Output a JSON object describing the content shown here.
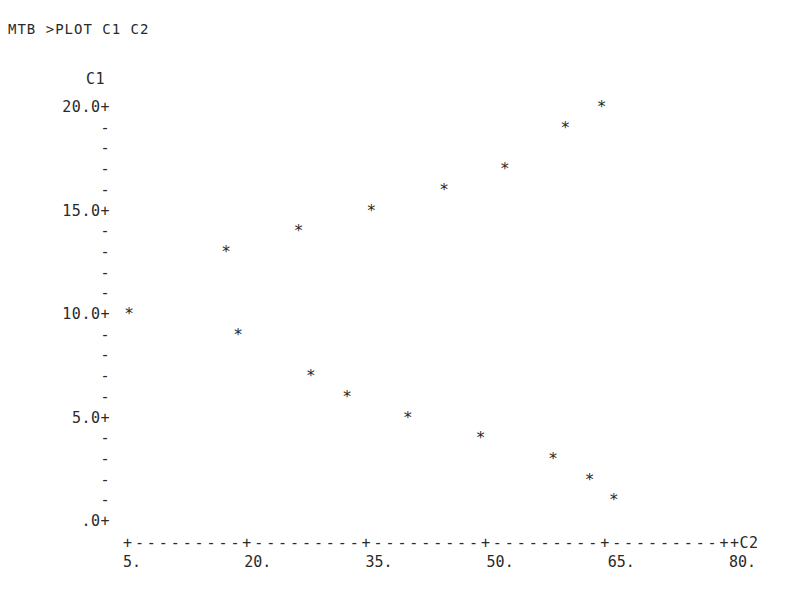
{
  "command": "MTB >PLOT C1 C2",
  "chart_data": {
    "type": "scatter",
    "title": "",
    "xlabel": "C2",
    "ylabel": "C1",
    "xlim": [
      5,
      80
    ],
    "ylim": [
      0,
      20
    ],
    "grid": false,
    "x_ticks": [
      "5.",
      "20.",
      "35.",
      "50.",
      "65.",
      "80."
    ],
    "y_ticks": [
      "20.0",
      "15.0",
      "10.0",
      "5.0",
      ".0"
    ],
    "marker": "*",
    "series": [
      {
        "name": "C1 vs C2",
        "points": [
          {
            "x": 5.0,
            "y": 10
          },
          {
            "x": 17.0,
            "y": 13
          },
          {
            "x": 18.5,
            "y": 9
          },
          {
            "x": 26.0,
            "y": 14
          },
          {
            "x": 27.5,
            "y": 7
          },
          {
            "x": 32.0,
            "y": 6
          },
          {
            "x": 35.0,
            "y": 15
          },
          {
            "x": 39.5,
            "y": 5
          },
          {
            "x": 44.0,
            "y": 16
          },
          {
            "x": 48.5,
            "y": 4
          },
          {
            "x": 51.5,
            "y": 17
          },
          {
            "x": 57.5,
            "y": 3
          },
          {
            "x": 59.0,
            "y": 19
          },
          {
            "x": 62.0,
            "y": 2
          },
          {
            "x": 63.5,
            "y": 20
          },
          {
            "x": 65.0,
            "y": 1
          }
        ]
      }
    ]
  },
  "axis_text": {
    "y_axis_label": "C1",
    "x_axis_label": "+C2",
    "x_axis_line": "+---------+---------+---------+---------+---------+",
    "y_rows": [
      "20.0+",
      "-",
      "-",
      "-",
      "-",
      "15.0+",
      "-",
      "-",
      "-",
      "-",
      "10.0+",
      "-",
      "-",
      "-",
      "-",
      "5.0+",
      "-",
      "-",
      "-",
      "-",
      ".0+"
    ]
  }
}
